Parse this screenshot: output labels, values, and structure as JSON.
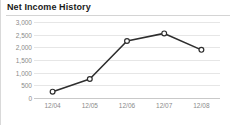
{
  "widget": {
    "title": "Net Income History",
    "background_color": "#ffffff",
    "border_color": "#d9d9d9"
  },
  "chart_data": {
    "type": "line",
    "title": "Net Income History",
    "xlabel": "",
    "ylabel": "",
    "categories": [
      "12/04",
      "12/05",
      "12/06",
      "12/07",
      "12/08"
    ],
    "values": [
      250,
      750,
      2250,
      2550,
      1900
    ],
    "series": [
      {
        "name": "Net Income",
        "values": [
          250,
          750,
          2250,
          2550,
          1900
        ]
      }
    ],
    "ylim": [
      0,
      3000
    ],
    "ytick_values": [
      3000,
      2500,
      2000,
      1500,
      1000,
      500,
      0
    ],
    "ytick_labels": [
      "3,000",
      "2,500",
      "2,000",
      "1,500",
      "1,000",
      "500",
      "0"
    ],
    "xtick_labels": [
      "12/04",
      "12/05",
      "12/06",
      "12/07",
      "12/08"
    ],
    "grid": true,
    "grid_color": "#e6e6e6",
    "legend": false,
    "legend_position": "none",
    "line_color": "#2e2e2e",
    "marker": "open-circle",
    "marker_fill": "#ffffff",
    "tick_label_color": "#8a8a8a"
  }
}
